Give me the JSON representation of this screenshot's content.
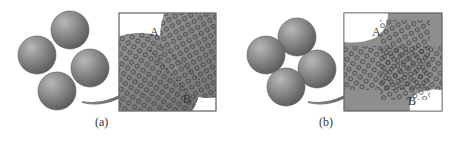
{
  "figure": {
    "panels": [
      {
        "id": "a",
        "caption": "(a)",
        "description": "Four loose spherical particles before sintering; inset shows atomic lattices at the contact between two particles",
        "inset_labels": [
          "A",
          "B"
        ]
      },
      {
        "id": "b",
        "caption": "(b)",
        "description": "Four sintered particles with neck formation and a small central pore; inset shows merged atomic lattices across the neck",
        "inset_labels": [
          "A",
          "B"
        ]
      }
    ]
  },
  "colors": {
    "sphere": "#7a7a7a",
    "sphere_highlight": "#b0b0b0",
    "inset_bg": "#8c8c8c",
    "atom_ring": "#3a3a3a",
    "arrow": "#555555"
  }
}
